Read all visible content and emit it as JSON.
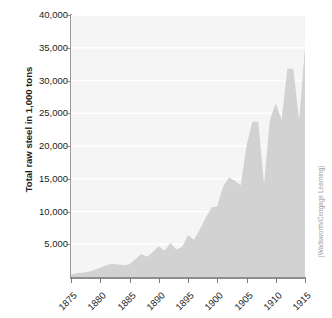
{
  "chart_data": {
    "type": "area",
    "title": "",
    "xlabel": "",
    "ylabel": "Total raw steel in 1,000 tons",
    "xlim": [
      1875,
      1915
    ],
    "ylim": [
      0,
      40000
    ],
    "grid": true,
    "legend": false,
    "x_tick_labels": [
      "1875",
      "1880",
      "1885",
      "1890",
      "1895",
      "1900",
      "1905",
      "1910",
      "1915"
    ],
    "y_tick_labels": [
      "5,000",
      "10,000",
      "15,000",
      "20,000",
      "25,000",
      "30,000",
      "35,000",
      "40,000"
    ],
    "y_tick_values": [
      5000,
      10000,
      15000,
      20000,
      25000,
      30000,
      35000,
      40000
    ],
    "x": [
      1875,
      1876,
      1877,
      1878,
      1879,
      1880,
      1881,
      1882,
      1883,
      1884,
      1885,
      1886,
      1887,
      1888,
      1889,
      1890,
      1891,
      1892,
      1893,
      1894,
      1895,
      1896,
      1897,
      1898,
      1899,
      1900,
      1901,
      1902,
      1903,
      1904,
      1905,
      1906,
      1907,
      1908,
      1909,
      1910,
      1911,
      1912,
      1913,
      1914,
      1915
    ],
    "values": [
      400,
      560,
      640,
      820,
      1050,
      1400,
      1800,
      2000,
      1900,
      1800,
      1950,
      2700,
      3500,
      3100,
      3800,
      4700,
      4000,
      5200,
      4200,
      4600,
      6400,
      5700,
      7200,
      9000,
      10600,
      10800,
      13800,
      15200,
      14700,
      14000,
      20000,
      23700,
      23700,
      14200,
      24000,
      26500,
      24000,
      31800,
      31800,
      24000,
      35000
    ],
    "annotations": [],
    "credit": "(Wadsworth/Cengage Learning)",
    "series_color": "#d2d2d2",
    "background_color": "#f5f5f5",
    "gridline_color": "#ffffff"
  }
}
